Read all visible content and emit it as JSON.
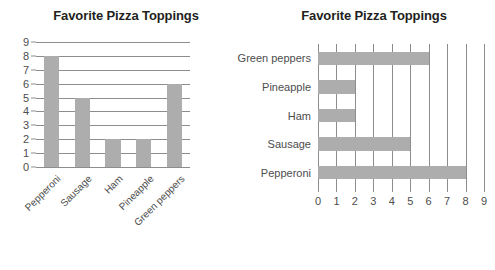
{
  "accent_colors": {
    "bar_fill": "#adadad",
    "gridline": "#8d8d8d",
    "title_text": "#231f20",
    "tick_text": "#4d4d4d",
    "background": "#ffffff"
  },
  "chart_data": [
    {
      "id": "vertical-bar-chart",
      "type": "bar",
      "orientation": "vertical",
      "title": "Favorite Pizza Toppings",
      "xlabel": "",
      "ylabel": "",
      "categories": [
        "Pepperoni",
        "Sausage",
        "Ham",
        "Pineapple",
        "Green peppers"
      ],
      "values": [
        8,
        5,
        2,
        2,
        6
      ],
      "ylim": [
        0,
        9
      ],
      "yticks": [
        0,
        1,
        2,
        3,
        4,
        5,
        6,
        7,
        8,
        9
      ],
      "ytick_labels": [
        "0",
        "1",
        "2",
        "3",
        "4",
        "5",
        "6",
        "7",
        "8",
        "9"
      ],
      "grid": "horizontal",
      "legend": "none",
      "xtick_label_rotation": "-45"
    },
    {
      "id": "horizontal-bar-chart",
      "type": "bar",
      "orientation": "horizontal",
      "title": "Favorite Pizza Toppings",
      "xlabel": "",
      "ylabel": "",
      "categories": [
        "Green peppers",
        "Pineapple",
        "Ham",
        "Sausage",
        "Pepperoni"
      ],
      "values": [
        6,
        2,
        2,
        5,
        8
      ],
      "xlim": [
        0,
        9
      ],
      "xticks": [
        0,
        1,
        2,
        3,
        4,
        5,
        6,
        7,
        8,
        9
      ],
      "xtick_labels": [
        "0",
        "1",
        "2",
        "3",
        "4",
        "5",
        "6",
        "7",
        "8",
        "9"
      ],
      "grid": "vertical",
      "legend": "none"
    }
  ]
}
